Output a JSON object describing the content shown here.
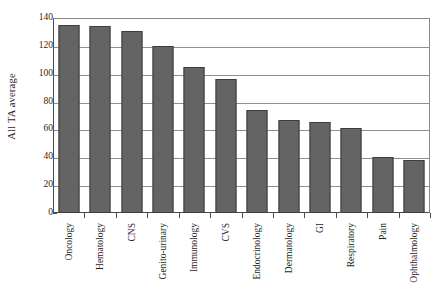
{
  "chart_data": {
    "type": "bar",
    "title": "",
    "xlabel": "",
    "ylabel": "All TA average",
    "ylim": [
      0,
      140
    ],
    "yticks": [
      0,
      20,
      40,
      60,
      80,
      100,
      120,
      140
    ],
    "grid": true,
    "legend": "none",
    "bar_color": "#646464",
    "bar_edge_color": "#3d3d3d",
    "categories": [
      "Oncology",
      "Hematology",
      "CNS",
      "Genito-urinary",
      "Immunology",
      "CVS",
      "Endocrinology",
      "Dermatology",
      "GI",
      "Respiratory",
      "Pain",
      "Ophthalmology"
    ],
    "values": [
      135,
      134,
      131,
      120,
      105,
      96,
      74,
      67,
      65,
      61,
      40,
      38
    ]
  }
}
